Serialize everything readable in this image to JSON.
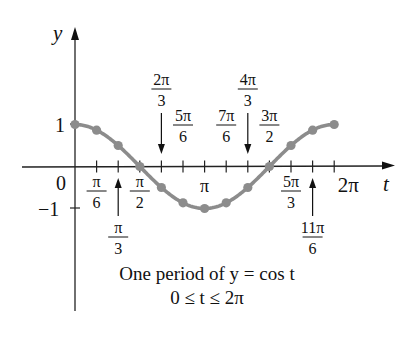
{
  "chart_data": {
    "type": "line",
    "title": "One period of y = cos t",
    "subtitle": "0 ≤ t ≤ 2π",
    "xlabel": "t",
    "ylabel": "y",
    "xlim": [
      0,
      6.2832
    ],
    "ylim": [
      -1,
      1
    ],
    "grid": false,
    "legend": null,
    "series": [
      {
        "name": "y = cos t",
        "color": "#8c8c8c",
        "x_labels": [
          "0",
          "π/6",
          "π/3",
          "π/2",
          "2π/3",
          "5π/6",
          "π",
          "7π/6",
          "4π/3",
          "3π/2",
          "5π/3",
          "11π/6",
          "2π"
        ],
        "x": [
          0,
          0.5236,
          1.0472,
          1.5708,
          2.0944,
          2.618,
          3.1416,
          3.6652,
          4.1888,
          4.7124,
          5.236,
          5.7596,
          6.2832
        ],
        "values": [
          1,
          0.866,
          0.5,
          0,
          -0.5,
          -0.866,
          -1,
          -0.866,
          -0.5,
          0,
          0.5,
          0.866,
          1
        ]
      }
    ],
    "y_ticks": [
      {
        "value": 1,
        "label": "1"
      },
      {
        "value": 0,
        "label": "0"
      },
      {
        "value": -1,
        "label": "−1"
      }
    ],
    "x_tick_labels": [
      {
        "k": 1,
        "num": "π",
        "den": "6",
        "pos": "below",
        "arrow": false
      },
      {
        "k": 2,
        "num": "π",
        "den": "3",
        "pos": "below",
        "arrow": true
      },
      {
        "k": 3,
        "num": "π",
        "den": "2",
        "pos": "below",
        "arrow": false
      },
      {
        "k": 4,
        "num": "2π",
        "den": "3",
        "pos": "above",
        "arrow": true
      },
      {
        "k": 5,
        "num": "5π",
        "den": "6",
        "pos": "above",
        "arrow": false
      },
      {
        "k": 6,
        "num": "π",
        "den": "",
        "pos": "below",
        "arrow": false
      },
      {
        "k": 7,
        "num": "7π",
        "den": "6",
        "pos": "above",
        "arrow": false
      },
      {
        "k": 8,
        "num": "4π",
        "den": "3",
        "pos": "above",
        "arrow": true
      },
      {
        "k": 9,
        "num": "3π",
        "den": "2",
        "pos": "above",
        "arrow": false
      },
      {
        "k": 10,
        "num": "5π",
        "den": "3",
        "pos": "below",
        "arrow": false
      },
      {
        "k": 11,
        "num": "11π",
        "den": "6",
        "pos": "below",
        "arrow": true
      },
      {
        "k": 12,
        "num": "2π",
        "den": "",
        "pos": "below",
        "arrow": false
      }
    ]
  },
  "caption": {
    "line1": "One period of y = cos t",
    "line2": "0 ≤ t ≤ 2π"
  },
  "axes": {
    "x_label": "t",
    "y_label": "y",
    "origin_label": "0",
    "y_one": "1",
    "y_minus_one": "−1"
  }
}
